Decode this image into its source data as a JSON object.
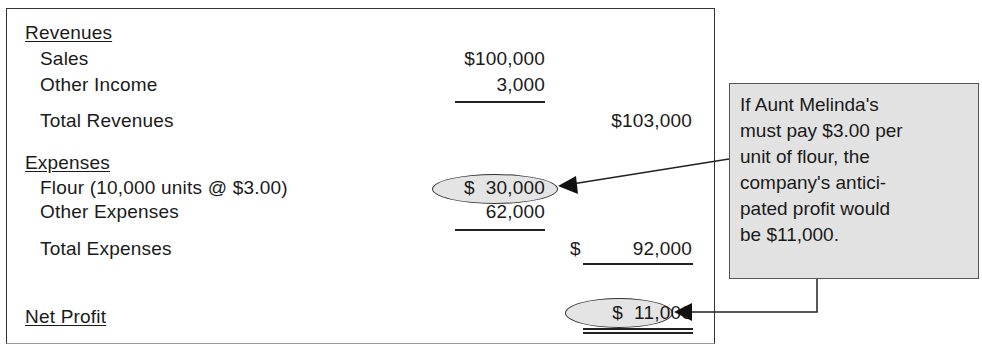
{
  "statement": {
    "revenues": {
      "heading": "Revenues",
      "sales_label": "Sales",
      "sales_value": "$100,000",
      "other_income_label": "Other Income",
      "other_income_value": "3,000",
      "total_label": "Total Revenues",
      "total_value": "$103,000"
    },
    "expenses": {
      "heading": "Expenses",
      "flour_label": "Flour (10,000 units @ $3.00)",
      "flour_value": "$  30,000",
      "other_label": "Other Expenses",
      "other_value": "62,000",
      "total_label": "Total Expenses",
      "total_value_prefix": "$",
      "total_value": "92,000"
    },
    "net_profit": {
      "label": "Net Profit",
      "value": "$  11,000"
    }
  },
  "callout": {
    "lines": [
      "If Aunt Melinda's",
      "must pay $3.00 per",
      "unit of flour, the",
      "company's antici-",
      "pated profit would",
      "be $11,000."
    ]
  },
  "colors": {
    "highlight_fill": "#e4e4e4",
    "callout_fill": "#e2e2e2",
    "border": "#333333"
  }
}
